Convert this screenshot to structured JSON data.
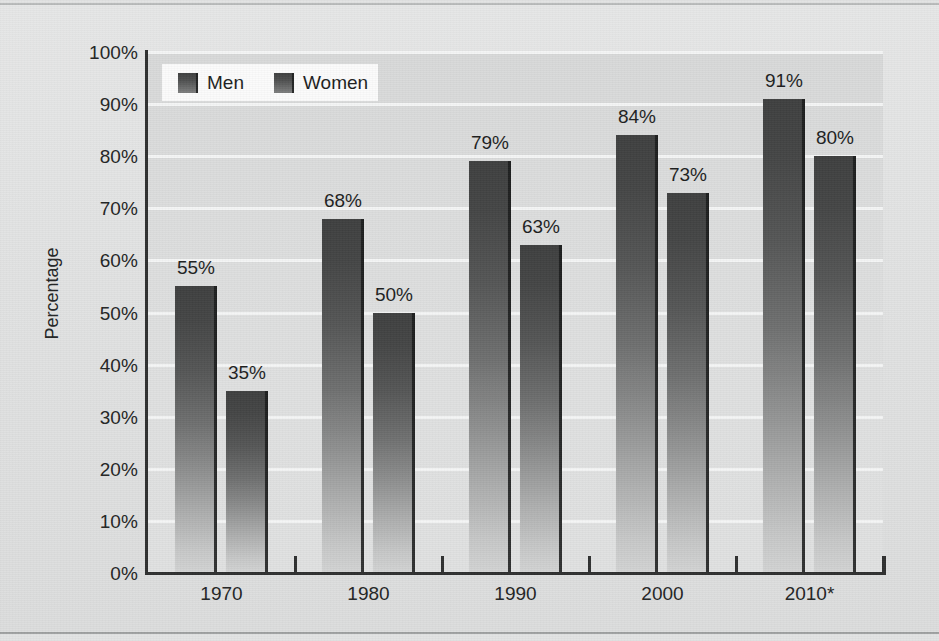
{
  "chart_data": {
    "type": "bar",
    "title": "",
    "subtitle": "",
    "xlabel": "",
    "ylabel": "Percentage",
    "categories": [
      "1970",
      "1980",
      "1990",
      "2000",
      "2010*"
    ],
    "series": [
      {
        "name": "Men",
        "values": [
          55,
          68,
          79,
          84,
          91
        ],
        "color": "#4a4b4b"
      },
      {
        "name": "Women",
        "values": [
          35,
          50,
          63,
          73,
          80
        ],
        "color": "#4a4b4b"
      }
    ],
    "data_labels": {
      "Men": [
        "55%",
        "68%",
        "79%",
        "84%",
        "91%"
      ],
      "Women": [
        "35%",
        "50%",
        "63%",
        "73%",
        "80%"
      ]
    },
    "ylim": [
      0,
      100
    ],
    "ytick_step": 10,
    "ytick_labels": [
      "100%",
      "90%",
      "80%",
      "70%",
      "60%",
      "50%",
      "40%",
      "30%",
      "20%",
      "10%",
      "0%"
    ],
    "ytick_values": [
      100,
      90,
      80,
      70,
      60,
      50,
      40,
      30,
      20,
      10,
      0
    ],
    "grid": "horizontal",
    "legend_position": "top-left",
    "legend_entries": [
      "Men",
      "Women"
    ],
    "value_suffix": "%"
  },
  "axes": {
    "y_title": "Percentage"
  },
  "legend": {
    "men_label": "Men",
    "women_label": "Women"
  },
  "colors": {
    "bar_top": "#3e3f3f",
    "bar_bottom": "#d2d3d3",
    "bar_edge": "#191a1a",
    "plot_background": "#dcdddd",
    "figure_background": "#e2e3e3",
    "gridline": "#f4f5f5",
    "axis": "#2f3030",
    "text": "#232424",
    "legend_background": "#fbfbfb"
  }
}
